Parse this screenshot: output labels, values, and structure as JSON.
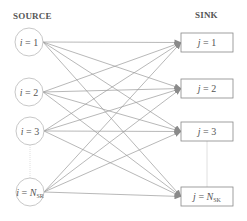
{
  "headers": {
    "source": "SOURCE",
    "sink": "SINK"
  },
  "sources": [
    {
      "var": "i",
      "eq": " = ",
      "val": "1",
      "sub": "",
      "cx": 29,
      "cy": 42
    },
    {
      "var": "i",
      "eq": " = ",
      "val": "2",
      "sub": "",
      "cx": 29,
      "cy": 92
    },
    {
      "var": "i",
      "eq": " = ",
      "val": "3",
      "sub": "",
      "cx": 30,
      "cy": 131
    },
    {
      "var": "i",
      "eq": " = ",
      "val": "N",
      "sub": "SR",
      "cx": 30,
      "cy": 192
    }
  ],
  "sinks": [
    {
      "var": "j",
      "eq": " = ",
      "val": "1",
      "sub": "",
      "y": 33
    },
    {
      "var": "j",
      "eq": " = ",
      "val": "2",
      "sub": "",
      "y": 79
    },
    {
      "var": "j",
      "eq": " = ",
      "val": "3",
      "sub": "",
      "y": 122
    },
    {
      "var": "j",
      "eq": " = ",
      "val": "N",
      "sub": "SK",
      "y": 187
    }
  ],
  "colors": {
    "line": "#9a9a9a",
    "node_stroke": "#c8c8c8",
    "box_stroke": "#888888",
    "text": "#555555"
  }
}
